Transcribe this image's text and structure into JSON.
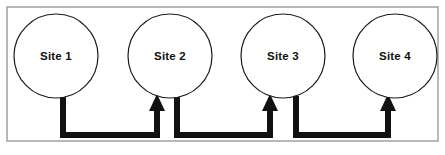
{
  "figure": {
    "type": "node-link-diagram",
    "background_color": "#ffffff",
    "frame": {
      "name": "diagram-border",
      "x": 7,
      "y": 7,
      "width": 431,
      "height": 134,
      "stroke_color": "#9a9a9a",
      "stroke_width": 1.4,
      "fill_color": "#ffffff"
    },
    "geometry": {
      "node_radius": 42,
      "node_center_y": 56,
      "node_stroke_color": "#1a1a1a",
      "node_stroke_width": 1.2,
      "node_fill_color": "#ffffff",
      "connector_color": "#111111",
      "connector_width": 6,
      "connector_bottom_y": 135,
      "arrow_head_width": 16,
      "arrow_head_height": 17,
      "arrow_tip_y": 94
    },
    "nodes": [
      {
        "id": "site-1",
        "label": "Site 1",
        "cx": 56,
        "cy": 56
      },
      {
        "id": "site-2",
        "label": "Site 2",
        "cx": 170,
        "cy": 56
      },
      {
        "id": "site-3",
        "label": "Site 3",
        "cx": 283,
        "cy": 56
      },
      {
        "id": "site-4",
        "label": "Site 4",
        "cx": 395,
        "cy": 56
      }
    ],
    "connectors": [
      {
        "id": "edge-site1-site2",
        "from": "site-1",
        "to": "site-2",
        "label": "",
        "source_x": 63,
        "target_x": 157,
        "drop_from_y": 96,
        "bottom_y": 135,
        "arrow_tip_y": 94
      },
      {
        "id": "edge-site2-site3",
        "from": "site-2",
        "to": "site-3",
        "label": "",
        "source_x": 177,
        "target_x": 270,
        "drop_from_y": 96,
        "bottom_y": 135,
        "arrow_tip_y": 94
      },
      {
        "id": "edge-site3-site4",
        "from": "site-3",
        "to": "site-4",
        "label": "",
        "source_x": 296,
        "target_x": 388,
        "drop_from_y": 96,
        "bottom_y": 135,
        "arrow_tip_y": 94
      }
    ]
  }
}
